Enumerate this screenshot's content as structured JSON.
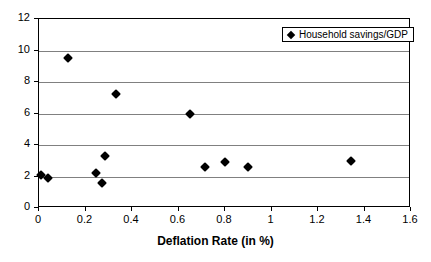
{
  "chart_data": {
    "type": "scatter",
    "title": "",
    "xlabel": "Deflation Rate (in %)",
    "ylabel": "",
    "xlim": [
      0,
      1.6
    ],
    "ylim": [
      0,
      12
    ],
    "xticks": [
      "0",
      "0.2",
      "0.4",
      "0.6",
      "0.8",
      "1",
      "1.2",
      "1.4",
      "1.6"
    ],
    "xtick_values": [
      0,
      0.2,
      0.4,
      0.6,
      0.8,
      1.0,
      1.2,
      1.4,
      1.6
    ],
    "yticks": [
      "0",
      "2",
      "4",
      "6",
      "8",
      "10",
      "12"
    ],
    "ytick_values": [
      0,
      2,
      4,
      6,
      8,
      10,
      12
    ],
    "grid": "horizontal",
    "legend_position": "top-right",
    "marker": "diamond",
    "marker_color": "#000000",
    "series": [
      {
        "name": "Household savings/GDP",
        "points": [
          {
            "x": 0.01,
            "y": 2.1
          },
          {
            "x": 0.04,
            "y": 1.9
          },
          {
            "x": 0.125,
            "y": 9.5
          },
          {
            "x": 0.245,
            "y": 2.25
          },
          {
            "x": 0.27,
            "y": 1.6
          },
          {
            "x": 0.285,
            "y": 3.3
          },
          {
            "x": 0.33,
            "y": 7.25
          },
          {
            "x": 0.65,
            "y": 5.95
          },
          {
            "x": 0.715,
            "y": 2.6
          },
          {
            "x": 0.8,
            "y": 2.9
          },
          {
            "x": 0.9,
            "y": 2.6
          },
          {
            "x": 1.34,
            "y": 3.0
          }
        ]
      }
    ]
  },
  "legend": {
    "entries": [
      {
        "label": "Household savings/GDP",
        "marker": "diamond-marker"
      }
    ]
  },
  "axes": {
    "x_title": "Deflation Rate (in %)"
  }
}
